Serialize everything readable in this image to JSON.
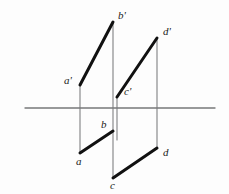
{
  "figure": {
    "background_color": "#fdfdfd",
    "ground_line_color": "#77787a",
    "projector_color": "#8a8b8d",
    "segment_color": "#111111"
  },
  "chart_data": {
    "type": "diagram",
    "xlabel": "",
    "ylabel": "",
    "xlim": [
      0,
      229
    ],
    "ylim": [
      0,
      194
    ],
    "grid": false,
    "legend": "none",
    "axes": [
      {
        "name": "ground-line",
        "label": "XY",
        "orientation": "horizontal",
        "x1": 25,
        "y1": 108,
        "x2": 215,
        "y2": 108,
        "color": "#77787a",
        "width": 1.4
      }
    ],
    "points": [
      {
        "id": "a_prime",
        "label": "a'",
        "x": 80,
        "y": 85,
        "view": "front",
        "label_dx": -16,
        "label_dy": -10
      },
      {
        "id": "b_prime",
        "label": "b'",
        "x": 113,
        "y": 22,
        "view": "front",
        "label_dx": 5,
        "label_dy": -12
      },
      {
        "id": "c_prime",
        "label": "c'",
        "x": 117,
        "y": 97,
        "view": "front",
        "label_dx": 7,
        "label_dy": -11
      },
      {
        "id": "d_prime",
        "label": "d'",
        "x": 157,
        "y": 38,
        "view": "front",
        "label_dx": 6,
        "label_dy": -12
      },
      {
        "id": "a",
        "label": "a",
        "x": 80,
        "y": 153,
        "view": "top",
        "label_dx": -4,
        "label_dy": 3
      },
      {
        "id": "b",
        "label": "b",
        "x": 113,
        "y": 131,
        "view": "top",
        "label_dx": -12,
        "label_dy": -12
      },
      {
        "id": "c",
        "label": "c",
        "x": 113,
        "y": 178,
        "view": "top",
        "label_dx": -3,
        "label_dy": 2
      },
      {
        "id": "d",
        "label": "d",
        "x": 157,
        "y": 148,
        "view": "top",
        "label_dx": 6,
        "label_dy": -1
      }
    ],
    "segments": [
      {
        "id": "seg-ab-front",
        "from": "a_prime",
        "to": "b_prime",
        "x1": 80,
        "y1": 85,
        "x2": 113,
        "y2": 22,
        "style": "thick",
        "color": "#111111",
        "width": 3.0
      },
      {
        "id": "seg-cd-front",
        "from": "c_prime",
        "to": "d_prime",
        "x1": 117,
        "y1": 97,
        "x2": 157,
        "y2": 38,
        "style": "thick",
        "color": "#111111",
        "width": 3.0
      },
      {
        "id": "seg-ab-top",
        "from": "a",
        "to": "b",
        "x1": 80,
        "y1": 153,
        "x2": 113,
        "y2": 131,
        "style": "thick",
        "color": "#111111",
        "width": 3.0
      },
      {
        "id": "seg-cd-top",
        "from": "c",
        "to": "d",
        "x1": 113,
        "y1": 178,
        "x2": 157,
        "y2": 148,
        "style": "thick",
        "color": "#111111",
        "width": 3.0
      }
    ],
    "projectors": [
      {
        "id": "proj-a",
        "label": "a'-a projector",
        "x1": 80,
        "y1": 85,
        "x2": 80,
        "y2": 153,
        "color": "#8a8b8d",
        "width": 1.2
      },
      {
        "id": "proj-b",
        "label": "b'-b-c projector",
        "x1": 113,
        "y1": 22,
        "x2": 113,
        "y2": 178,
        "color": "#8a8b8d",
        "width": 1.2
      },
      {
        "id": "proj-c",
        "label": "c'-c projector",
        "x1": 117,
        "y1": 97,
        "x2": 117,
        "y2": 140,
        "color": "#8a8b8d",
        "width": 1.2
      },
      {
        "id": "proj-d",
        "label": "d'-d projector",
        "x1": 157,
        "y1": 38,
        "x2": 157,
        "y2": 148,
        "color": "#8a8b8d",
        "width": 1.2
      }
    ]
  }
}
